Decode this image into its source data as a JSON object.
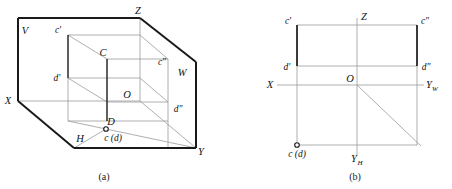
{
  "figure": {
    "background_color": "#ffffff",
    "stroke_dark": "#1a1a1a",
    "stroke_light": "#8a8a8a",
    "stroke_mid": "#555555",
    "panels": [
      {
        "id": "a",
        "caption": "(a)",
        "caption_x": 104,
        "caption_y": 178,
        "description": "Three-dimensional pictorial view of the V, H and W projection planes with a box showing points C and D",
        "plane_labels": [
          {
            "name": "plane-label-v",
            "text": "V",
            "x": 25,
            "y": 34
          },
          {
            "name": "plane-label-h",
            "text": "H",
            "x": 80,
            "y": 142
          },
          {
            "name": "plane-label-w",
            "text": "W",
            "x": 182,
            "y": 76
          }
        ],
        "axis_labels": [
          {
            "name": "axis-label-x",
            "text": "X",
            "x": 8,
            "y": 104
          },
          {
            "name": "axis-label-y",
            "text": "Y",
            "x": 200,
            "y": 155
          },
          {
            "name": "axis-label-z",
            "text": "Z",
            "x": 137,
            "y": 14
          }
        ],
        "point_labels": [
          {
            "name": "point-label-c-front",
            "text": "c'",
            "x": 57,
            "y": 34
          },
          {
            "name": "point-label-c",
            "text": "C",
            "x": 101,
            "y": 56
          },
          {
            "name": "point-label-c-side",
            "text": "c″",
            "x": 160,
            "y": 66
          },
          {
            "name": "point-label-d-front",
            "text": "d'",
            "x": 55,
            "y": 81
          },
          {
            "name": "point-label-d",
            "text": "D",
            "x": 107,
            "y": 126
          },
          {
            "name": "point-label-d-side",
            "text": "d″",
            "x": 177,
            "y": 113
          },
          {
            "name": "point-label-origin",
            "text": "O",
            "x": 124,
            "y": 98
          },
          {
            "name": "point-label-cd-top",
            "text": "c (d)",
            "x": 100,
            "y": 143
          }
        ]
      },
      {
        "id": "b",
        "caption": "(b)",
        "caption_x": 355,
        "caption_y": 178,
        "description": "Two-dimensional multi-view drawing with the X, Yw, Yh and Z axes",
        "axis_labels": [
          {
            "name": "axis-label-x",
            "text": "X",
            "x": 270,
            "y": 88
          },
          {
            "name": "axis-label-yw",
            "text": "Y",
            "x": 427,
            "y": 88,
            "sub": "W",
            "sub_x": 434,
            "sub_y": 91
          },
          {
            "name": "axis-label-yh",
            "text": "Y",
            "x": 353,
            "y": 162,
            "sub": "H",
            "sub_x": 360,
            "sub_y": 165
          },
          {
            "name": "axis-label-z",
            "text": "Z",
            "x": 362,
            "y": 20
          }
        ],
        "point_labels": [
          {
            "name": "point-label-c-front",
            "text": "c'",
            "x": 286,
            "y": 26
          },
          {
            "name": "point-label-c-side",
            "text": "c″",
            "x": 420,
            "y": 26
          },
          {
            "name": "point-label-d-front",
            "text": "d'",
            "x": 284,
            "y": 70
          },
          {
            "name": "point-label-d-side",
            "text": "d″",
            "x": 420,
            "y": 70
          },
          {
            "name": "point-label-origin",
            "text": "O",
            "x": 347,
            "y": 82
          },
          {
            "name": "point-label-cd-top",
            "text": "c (d)",
            "x": 284,
            "y": 155
          }
        ]
      }
    ],
    "geometry": {
      "panel_a": {
        "v_plane_outline": "M 18,18 L 140,18 L 196,62 L 196,148 L 74,148 L 18,101 Z",
        "v_plane_left_edge": "M 18,18 L 18,101",
        "v_plane_top_edge": "M 18,18 L 140,18",
        "z_to_w_edge": "M 140,18 L 196,62",
        "w_right_edge": "M 196,62 L 196,148",
        "h_bottom_edge": "M 74,148 L 196,148",
        "x_to_h_edge": "M 18,101 L 74,148",
        "axis_x_horizontal": "M 18,101 L 140,101",
        "axis_z_vertical": "M 140,18 L 140,101",
        "axis_y_diagonal": "M 140,101 L 196,148",
        "box_front_top": "M 68,35 L 140,35",
        "box_front_left": "M 68,35 L 68,78",
        "box_front_bottom": "M 68,78 L 140,78",
        "box_c_diag": "M 68,35 L 107,59",
        "box_d_diag": "M 68,78 L 107,102",
        "box_cc_vertical": "M 107,59 L 107,102",
        "box_c_to_cs": "M 107,59 L 168,59",
        "box_cs_vertical": "M 168,59 L 168,102",
        "box_d_to_ds": "M 107,102 L 168,102",
        "box_right_top_diag": "M 140,35 L 168,59",
        "box_right_bottom_diag": "M 140,78 L 168,102",
        "box_cc_down": "M 107,59 L 107,121",
        "box_bottom_left_vertical": "M 68,78 L 68,121",
        "box_bottom_front": "M 68,121 L 107,121",
        "box_bottom_diag": "M 68,121 L 106,129",
        "box_bottom_rect_top": "M 107,121 L 168,121",
        "box_bottom_rect_right": "M 168,102 L 168,148",
        "box_cd_to_y": "M 106,129 L 196,148",
        "box_ground_left": "M 74,148 L 106,129",
        "point_marker_cd": {
          "cx": 106,
          "cy": 129,
          "r": 2.4
        }
      },
      "panel_b": {
        "rect_top": "M 297,25 L 417,25",
        "rect_left": "M 297,25 L 297,66",
        "rect_bottom": "M 297,66 L 417,66",
        "rect_right": "M 417,25 L 417,66",
        "axis_x": "M 277,85 L 357,85",
        "axis_yw": "M 357,85 L 424,85",
        "axis_z": "M 357,18 L 357,85",
        "axis_yh": "M 357,85 L 357,155",
        "proj_left_vertical": "M 297,25 L 297,145",
        "proj_right_vertical": "M 417,25 L 417,145",
        "bottom_horizontal": "M 297,145 L 417,145",
        "diagonal_45": "M 357,85 L 420,145",
        "point_marker_cd": {
          "cx": 297,
          "cy": 145,
          "r": 2.4
        }
      }
    }
  }
}
